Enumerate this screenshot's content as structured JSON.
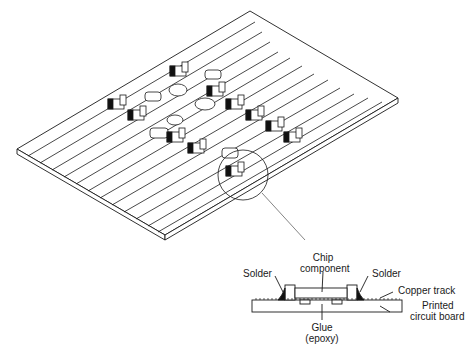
{
  "figure": {
    "colors": {
      "ink": "#1a1a1a",
      "background": "#ffffff"
    }
  },
  "detail": {
    "labels": {
      "chip_line1": "Chip",
      "chip_line2": "component",
      "solder_left": "Solder",
      "solder_right": "Solder",
      "copper_track": "Copper track",
      "pcb_line1": "Printed",
      "pcb_line2": "circuit board",
      "glue_line1": "Glue",
      "glue_line2": "(epoxy)"
    }
  }
}
